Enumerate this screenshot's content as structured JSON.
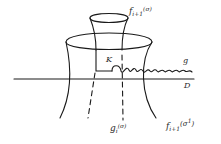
{
  "diagram": {
    "type": "topological surface sketch",
    "colors": {
      "stroke": "#1a1a1a",
      "label": "#2a2a2a",
      "background": "#ffffff"
    },
    "labels": {
      "f_top": {
        "base": "f",
        "sub": "i+1",
        "arg": "(σ)"
      },
      "f_bottom": {
        "base": "f",
        "sub": "i+1",
        "arg_open": "(σ",
        "arg_sup": "1",
        "arg_close": ")"
      },
      "g_i": {
        "base": "g",
        "sub": "i",
        "arg": "(σ)"
      },
      "K": "K",
      "g": "g",
      "D": "D"
    },
    "elements": [
      "outer funnel surface",
      "inner cup (top)",
      "horizontal plane line D",
      "wavy curve g",
      "dashed vertical lines",
      "rectangular corner K"
    ]
  }
}
